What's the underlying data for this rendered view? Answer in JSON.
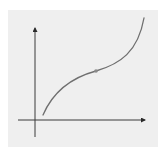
{
  "diagram": {
    "type": "function-graph",
    "colors": {
      "background": "#ffffff",
      "panel": "#efefef",
      "axis": "#3a3a3a",
      "curve": "#6f6f6f",
      "point": "#8a8a8a"
    },
    "axes": {
      "x_label": "",
      "y_label": "",
      "origin": [
        35,
        120
      ],
      "x_end": [
        146,
        120
      ],
      "y_end": [
        35,
        27
      ]
    },
    "curve": {
      "start": [
        43,
        115
      ],
      "inflection_point": [
        96,
        71
      ],
      "end": [
        144,
        18
      ]
    }
  }
}
